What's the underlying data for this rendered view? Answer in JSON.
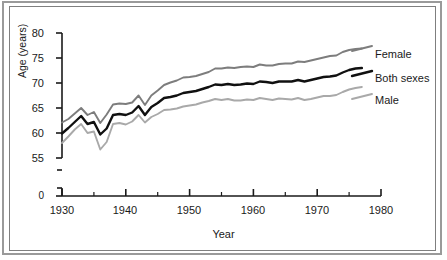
{
  "chart_data": {
    "type": "line",
    "title": "",
    "subtitle": "",
    "xlabel": "Year",
    "ylabel": "Age (years)",
    "xlim": [
      1930,
      1980
    ],
    "ylim": [
      55,
      80
    ],
    "y_axis_break": true,
    "y_axis_break_note": "axis broken between 0 and 55",
    "grid": false,
    "legend_position": "right-inline-labels",
    "xticks": [
      1930,
      1940,
      1950,
      1960,
      1970,
      1980
    ],
    "xtick_labels": [
      "1930",
      "1940",
      "1950",
      "1960",
      "1970",
      "1980"
    ],
    "xminor_ticks": [
      1935,
      1945,
      1955,
      1965,
      1975
    ],
    "yticks": [
      0,
      55,
      60,
      65,
      70,
      75,
      80
    ],
    "ytick_labels": [
      "0",
      "55",
      "60",
      "65",
      "70",
      "75",
      "80"
    ],
    "x": [
      1930,
      1931,
      1932,
      1933,
      1934,
      1935,
      1936,
      1937,
      1938,
      1939,
      1940,
      1941,
      1942,
      1943,
      1944,
      1945,
      1946,
      1947,
      1948,
      1949,
      1950,
      1951,
      1952,
      1953,
      1954,
      1955,
      1956,
      1957,
      1958,
      1959,
      1960,
      1961,
      1962,
      1963,
      1964,
      1965,
      1966,
      1967,
      1968,
      1969,
      1970,
      1971,
      1972,
      1973,
      1974,
      1975,
      1976,
      1977
    ],
    "series": [
      {
        "name": "Female",
        "color": "#7d7d7d",
        "values": [
          62.1,
          62.8,
          63.9,
          65.0,
          63.6,
          64.2,
          62.0,
          63.7,
          65.7,
          65.9,
          65.8,
          66.1,
          67.5,
          65.6,
          67.5,
          68.5,
          69.6,
          70.1,
          70.5,
          71.1,
          71.2,
          71.4,
          71.8,
          72.2,
          72.9,
          72.9,
          73.1,
          73.0,
          73.2,
          73.3,
          73.2,
          73.7,
          73.5,
          73.5,
          73.8,
          73.9,
          73.9,
          74.3,
          74.2,
          74.5,
          74.8,
          75.1,
          75.4,
          75.5,
          76.2,
          76.6,
          76.8,
          76.9
        ]
      },
      {
        "name": "Both sexes",
        "color": "#101010",
        "values": [
          59.9,
          61.0,
          62.2,
          63.4,
          61.8,
          62.2,
          59.7,
          60.9,
          63.6,
          63.8,
          63.6,
          64.1,
          65.4,
          63.6,
          65.2,
          66.0,
          67.0,
          67.2,
          67.5,
          68.0,
          68.2,
          68.4,
          68.8,
          69.2,
          69.7,
          69.6,
          69.8,
          69.6,
          69.7,
          69.9,
          69.8,
          70.3,
          70.2,
          70.0,
          70.3,
          70.3,
          70.3,
          70.6,
          70.3,
          70.6,
          70.9,
          71.2,
          71.3,
          71.5,
          72.1,
          72.6,
          72.9,
          73.0
        ]
      },
      {
        "name": "Male",
        "color": "#a9a9a9",
        "values": [
          58.0,
          59.3,
          60.7,
          61.8,
          60.0,
          60.3,
          56.7,
          58.2,
          61.8,
          62.0,
          61.7,
          62.3,
          63.6,
          62.1,
          63.2,
          63.8,
          64.6,
          64.7,
          64.9,
          65.3,
          65.5,
          65.7,
          66.1,
          66.4,
          66.8,
          66.6,
          66.8,
          66.5,
          66.5,
          66.7,
          66.6,
          67.0,
          66.8,
          66.6,
          66.9,
          66.8,
          66.7,
          67.0,
          66.6,
          66.8,
          67.1,
          67.4,
          67.4,
          67.6,
          68.2,
          68.7,
          69.0,
          69.2
        ]
      }
    ]
  },
  "legend_labels": {
    "female": "Female",
    "both_sexes": "Both sexes",
    "male": "Male"
  },
  "axes": {
    "x_title": "Year",
    "y_title": "Age (years)"
  },
  "colors": {
    "female": "#7d7d7d",
    "both_sexes": "#101010",
    "male": "#a9a9a9",
    "axis": "#1a1a1a",
    "outer_frame": "#9a9a9a",
    "inner_frame": "#7f7f7f",
    "background": "#ffffff"
  }
}
